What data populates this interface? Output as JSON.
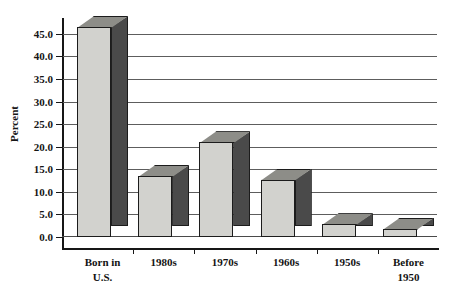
{
  "chart_data": {
    "type": "bar",
    "title": "",
    "subtitle": "",
    "xlabel": "",
    "ylabel": "Percent",
    "categories": [
      "Born in\nU.S.",
      "1980s",
      "1970s",
      "1960s",
      "1950s",
      "Before\n1950"
    ],
    "values": [
      46.5,
      13.5,
      21.0,
      12.7,
      2.8,
      1.8
    ],
    "ylim": [
      0.0,
      48.5
    ],
    "ytick_values": [
      0.0,
      5.0,
      10.0,
      15.0,
      20.0,
      25.0,
      30.0,
      35.0,
      40.0,
      45.0
    ],
    "ytick_labels": [
      "0.0",
      "5.0",
      "10.0",
      "15.0",
      "20.0",
      "25.0",
      "30.0",
      "35.0",
      "40.0",
      "45.0"
    ],
    "grid": true,
    "legend": "none",
    "style": "3d-grayscale",
    "colors": {
      "bar_front": "#d2d2ce",
      "bar_top": "#8d8d88",
      "bar_side": "#4a4a4a",
      "outline": "#1c1c1c",
      "gridline": "#5d5d5d",
      "axis": "#171717",
      "background": "#ffffff",
      "text": "#131313"
    }
  }
}
